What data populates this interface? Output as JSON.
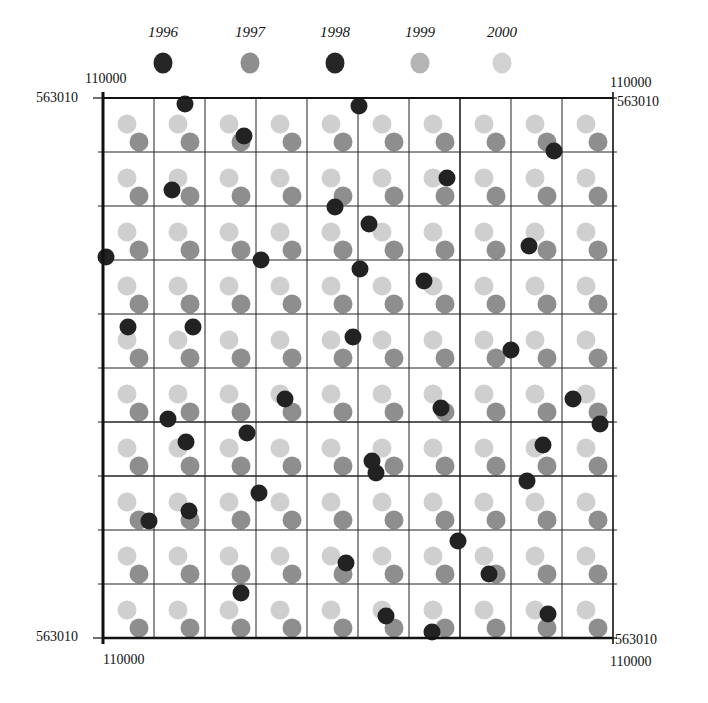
{
  "chart_data": {
    "type": "scatter",
    "title": "",
    "legend": {
      "position": "top",
      "entries": [
        {
          "label": "1996",
          "color": "#262626",
          "x": 163
        },
        {
          "label": "1997",
          "color": "#8e8e8e",
          "x": 250
        },
        {
          "label": "1998",
          "color": "#262626",
          "x": 335
        },
        {
          "label": "1999",
          "color": "#b4b4b4",
          "x": 420
        },
        {
          "label": "2000",
          "color": "#d2d2d2",
          "x": 502
        }
      ]
    },
    "corner_labels": {
      "top_left_x": "110000",
      "top_left_y": "563010",
      "top_right_x": "110000",
      "top_right_y": "563010",
      "bottom_left_x": "110000",
      "bottom_left_y": "563010",
      "bottom_right_x": "110000",
      "bottom_right_y": "563010"
    },
    "frame": {
      "left": 103,
      "top": 98,
      "right": 613,
      "bottom": 638
    },
    "grid": {
      "on": true,
      "columns": 10,
      "rows": 10
    },
    "regular_points": {
      "description": "Each grid cell contains one light point (upper-left) and one medium-gray point (lower-right)",
      "light_series": "2000",
      "light_color": "#cfcfcf",
      "light_offset": [
        24,
        26
      ],
      "medium_series": "1997",
      "medium_color": "#8e8e8e",
      "medium_offset": [
        36,
        44
      ]
    },
    "dark_points": {
      "series": "1996/1998",
      "color": "#222222",
      "points": [
        [
          185,
          104
        ],
        [
          359,
          106
        ],
        [
          244,
          136
        ],
        [
          554,
          151
        ],
        [
          447,
          178
        ],
        [
          172,
          190
        ],
        [
          335,
          207
        ],
        [
          369,
          224
        ],
        [
          529,
          246
        ],
        [
          106,
          257
        ],
        [
          261,
          260
        ],
        [
          360,
          269
        ],
        [
          424,
          281
        ],
        [
          128,
          327
        ],
        [
          193,
          327
        ],
        [
          353,
          337
        ],
        [
          511,
          350
        ],
        [
          573,
          399
        ],
        [
          168,
          419
        ],
        [
          441,
          408
        ],
        [
          600,
          424
        ],
        [
          186,
          442
        ],
        [
          247,
          433
        ],
        [
          543,
          445
        ],
        [
          372,
          461
        ],
        [
          376,
          473
        ],
        [
          527,
          481
        ],
        [
          259,
          493
        ],
        [
          189,
          511
        ],
        [
          149,
          521
        ],
        [
          458,
          541
        ],
        [
          346,
          563
        ],
        [
          489,
          574
        ],
        [
          241,
          593
        ],
        [
          386,
          616
        ],
        [
          548,
          614
        ],
        [
          432,
          632
        ],
        [
          285,
          399
        ]
      ]
    },
    "xlabel": "",
    "ylabel": ""
  }
}
